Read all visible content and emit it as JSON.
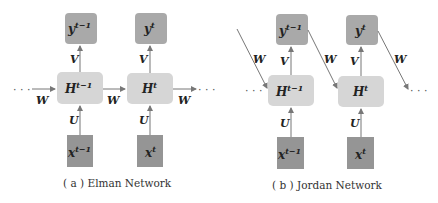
{
  "colors": {
    "output_box": "#a9a9a9",
    "hidden_box": "#d6d6d6",
    "input_box": "#959595",
    "arrow": "#777777"
  },
  "elman": {
    "caption": "( a ) Elman Network",
    "nodes": {
      "y_prev": {
        "base": "y",
        "sup": "t−1"
      },
      "y_cur": {
        "base": "y",
        "sup": "t"
      },
      "h_prev": {
        "base": "H",
        "sup": "t−1"
      },
      "h_cur": {
        "base": "H",
        "sup": "t"
      },
      "x_prev": {
        "base": "x",
        "sup": "t−1"
      },
      "x_cur": {
        "base": "x",
        "sup": "t"
      }
    },
    "weights": {
      "V": "V",
      "U": "U",
      "W": "W"
    },
    "ellipsis": "· · ·"
  },
  "jordan": {
    "caption": "( b ) Jordan Network",
    "nodes": {
      "y_prev": {
        "base": "y",
        "sup": "t−1"
      },
      "y_cur": {
        "base": "y",
        "sup": "t"
      },
      "h_prev": {
        "base": "H",
        "sup": "t−1"
      },
      "h_cur": {
        "base": "H",
        "sup": "t"
      },
      "x_prev": {
        "base": "x",
        "sup": "t−1"
      },
      "x_cur": {
        "base": "x",
        "sup": "t"
      }
    },
    "weights": {
      "V": "V",
      "U": "U",
      "W": "W"
    },
    "ellipsis": "· · ·"
  }
}
